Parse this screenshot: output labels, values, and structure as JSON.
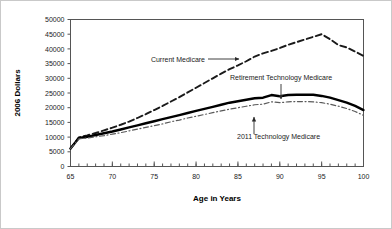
{
  "figure": {
    "background_color": "#ffffff",
    "border_color": "#c9c9c9"
  },
  "chart_data": {
    "type": "line",
    "title": "",
    "subtitle": "",
    "xlabel": "Age in Years",
    "ylabel": "2006 Dollars",
    "xlim": [
      65,
      100
    ],
    "ylim": [
      0,
      50000
    ],
    "grid": false,
    "legend_position": "inline-annotations",
    "x_ticks_major": [
      65,
      70,
      75,
      80,
      85,
      90,
      95,
      100
    ],
    "x_tick_labels": [
      "65",
      "70",
      "75",
      "80",
      "85",
      "90",
      "95",
      "100"
    ],
    "x_ticks_minor_step": 1,
    "y_ticks": [
      0,
      5000,
      10000,
      15000,
      20000,
      25000,
      30000,
      35000,
      40000,
      45000,
      50000
    ],
    "y_tick_labels": [
      "0",
      "5000",
      "10000",
      "15000",
      "20000",
      "25000",
      "30000",
      "35000",
      "40000",
      "45000",
      "50000"
    ],
    "x": [
      65,
      66,
      67,
      68,
      69,
      70,
      71,
      72,
      73,
      74,
      75,
      76,
      77,
      78,
      79,
      80,
      81,
      82,
      83,
      84,
      85,
      86,
      87,
      88,
      89,
      90,
      91,
      92,
      93,
      94,
      95,
      96,
      97,
      98,
      99,
      100
    ],
    "series": [
      {
        "name": "Current Medicare",
        "style": "dashed",
        "color": "#1a1a1a",
        "width": 1.9,
        "values": [
          6100,
          9900,
          10600,
          11400,
          12300,
          13200,
          14200,
          15300,
          16500,
          17800,
          19200,
          20600,
          22100,
          23600,
          25200,
          26800,
          28400,
          30000,
          31600,
          33100,
          34400,
          35800,
          37400,
          38500,
          39300,
          40300,
          41400,
          42300,
          43200,
          44100,
          45000,
          43300,
          41300,
          40500,
          39100,
          37600
        ]
      },
      {
        "name": "Retirement Technology Medicare",
        "style": "solid",
        "color": "#000000",
        "width": 2.4,
        "values": [
          6100,
          9700,
          10100,
          10700,
          11300,
          11900,
          12600,
          13300,
          14000,
          14700,
          15400,
          16100,
          16800,
          17500,
          18200,
          18900,
          19600,
          20300,
          21000,
          21700,
          22200,
          22700,
          23200,
          23400,
          24300,
          23900,
          24300,
          24400,
          24400,
          24400,
          24000,
          23400,
          22600,
          21700,
          20600,
          19200
        ]
      },
      {
        "name": "2011 Technology Medicare",
        "style": "dash-dot",
        "color": "#5a5a5a",
        "width": 1.2,
        "values": [
          6100,
          9400,
          9700,
          10100,
          10500,
          11000,
          11500,
          12100,
          12700,
          13300,
          13900,
          14500,
          15200,
          15800,
          16500,
          17100,
          17700,
          18300,
          18900,
          19500,
          20000,
          20500,
          21000,
          21200,
          22000,
          21700,
          22000,
          22100,
          22100,
          22000,
          21700,
          21200,
          20500,
          19700,
          18700,
          17400
        ]
      }
    ],
    "annotations": [
      {
        "name": "current-medicare-annotation",
        "label": "Current Medicare",
        "text_x": 205,
        "text_y": 62,
        "anchor": "end",
        "arrow_from_x": 208,
        "arrow_from_y": 59,
        "arrow_to_x": 239,
        "arrow_to_y": 59,
        "arrow_direction": "right"
      },
      {
        "name": "retirement-technology-medicare-annotation",
        "label": "Retirement Technology Medicare",
        "text_x": 230,
        "text_y": 80,
        "anchor": "start",
        "arrow_from_x": 281,
        "arrow_from_y": 84,
        "arrow_to_x": 281,
        "arrow_to_y": 99,
        "arrow_direction": "down"
      },
      {
        "name": "2011-technology-medicare-annotation",
        "label": "2011 Technology Medicare",
        "text_x": 237,
        "text_y": 139,
        "anchor": "start",
        "arrow_from_x": 254,
        "arrow_from_y": 134,
        "arrow_to_x": 254,
        "arrow_to_y": 117,
        "arrow_direction": "up"
      }
    ]
  }
}
